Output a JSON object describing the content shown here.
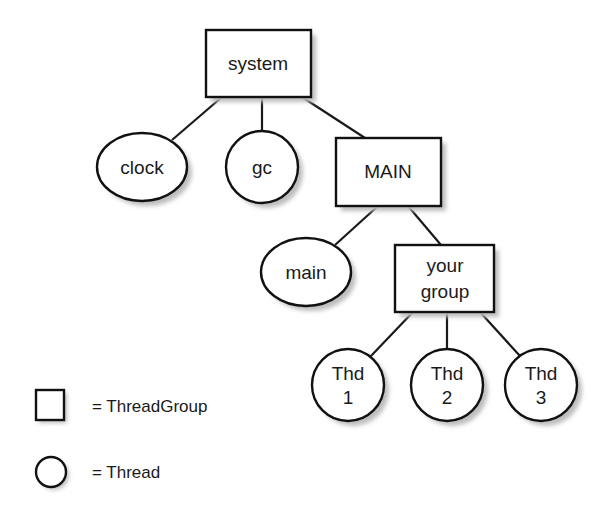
{
  "diagram": {
    "type": "tree",
    "nodes": [
      {
        "id": "system",
        "label_lines": [
          "system"
        ],
        "kind": "ThreadGroup",
        "parent": null
      },
      {
        "id": "clock",
        "label_lines": [
          "clock"
        ],
        "kind": "Thread",
        "parent": "system"
      },
      {
        "id": "gc",
        "label_lines": [
          "gc"
        ],
        "kind": "Thread",
        "parent": "system"
      },
      {
        "id": "MAIN",
        "label_lines": [
          "MAIN"
        ],
        "kind": "ThreadGroup",
        "parent": "system"
      },
      {
        "id": "main",
        "label_lines": [
          "main"
        ],
        "kind": "Thread",
        "parent": "MAIN"
      },
      {
        "id": "your_group",
        "label_lines": [
          "your",
          "group"
        ],
        "kind": "ThreadGroup",
        "parent": "MAIN"
      },
      {
        "id": "thd1",
        "label_lines": [
          "Thd",
          "1"
        ],
        "kind": "Thread",
        "parent": "your_group"
      },
      {
        "id": "thd2",
        "label_lines": [
          "Thd",
          "2"
        ],
        "kind": "Thread",
        "parent": "your_group"
      },
      {
        "id": "thd3",
        "label_lines": [
          "Thd",
          "3"
        ],
        "kind": "Thread",
        "parent": "your_group"
      }
    ],
    "labels": {
      "system": "system",
      "clock": "clock",
      "gc": "gc",
      "MAIN": "MAIN",
      "main": "main",
      "your_group_line1": "your",
      "your_group_line2": "group",
      "thd1_line1": "Thd",
      "thd1_line2": "1",
      "thd2_line1": "Thd",
      "thd2_line2": "2",
      "thd3_line1": "Thd",
      "thd3_line2": "3"
    },
    "legend": {
      "items": [
        {
          "shape": "square",
          "label": "= ThreadGroup"
        },
        {
          "shape": "circle",
          "label": "= Thread"
        }
      ]
    },
    "colors": {
      "stroke": "#111111",
      "fill": "#ffffff",
      "shadow": "#bdbdbd",
      "background": "#ffffff"
    }
  }
}
